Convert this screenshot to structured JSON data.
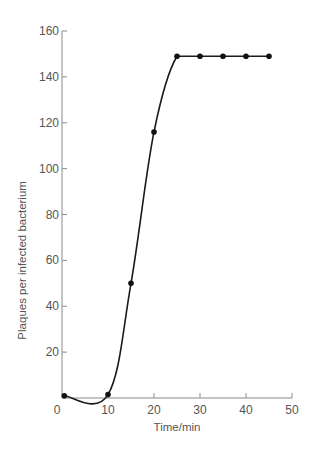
{
  "chart_data": {
    "type": "line",
    "title": "",
    "xlabel": "Time/min",
    "ylabel": "Plaques per infected bacterium",
    "xlim": [
      0,
      50
    ],
    "ylim": [
      0,
      160
    ],
    "xticks": [
      0,
      10,
      20,
      30,
      40,
      50
    ],
    "xtick_labels": [
      "0",
      "10",
      "20",
      "30",
      "40",
      "50"
    ],
    "yticks": [
      20,
      40,
      60,
      80,
      100,
      120,
      140,
      160
    ],
    "ytick_labels": [
      "20",
      "40",
      "60",
      "80",
      "100",
      "120",
      "140",
      "160"
    ],
    "grid": false,
    "legend": null,
    "series": [
      {
        "name": "Plaques per infected bacterium",
        "x": [
          0.5,
          10,
          15,
          20,
          25,
          30,
          35,
          40,
          45
        ],
        "y": [
          1,
          1.5,
          50,
          116,
          149,
          149,
          149,
          149,
          149
        ],
        "color": "#111111",
        "marker": "filled-circle",
        "smooth_curve": true
      }
    ]
  }
}
